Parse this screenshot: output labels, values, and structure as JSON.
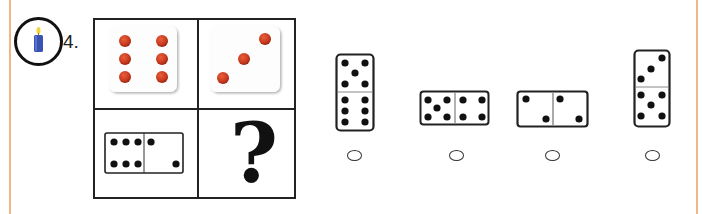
{
  "question": {
    "number_label": "4.",
    "badge_icon": "candle-icon",
    "colors": {
      "page_edge": "#f2b58a",
      "candle_body": "#3a52b0",
      "candle_flame": "#f6d23a",
      "die_pip": "#c8391e",
      "ink": "#111111"
    },
    "grid": {
      "cells": [
        {
          "position": "top-left",
          "type": "die",
          "pips": 6
        },
        {
          "position": "top-right",
          "type": "die",
          "pips": 3
        },
        {
          "position": "bottom-left",
          "type": "domino",
          "orientation": "horizontal",
          "halves": [
            6,
            2
          ]
        },
        {
          "position": "bottom-right",
          "type": "unknown",
          "symbol": "?"
        }
      ],
      "unknown_symbol": "?"
    },
    "options": [
      {
        "id": "A",
        "type": "domino",
        "orientation": "vertical",
        "halves": [
          5,
          6
        ],
        "selected": false
      },
      {
        "id": "B",
        "type": "domino",
        "orientation": "horizontal",
        "halves": [
          5,
          4
        ],
        "selected": false
      },
      {
        "id": "C",
        "type": "domino",
        "orientation": "horizontal",
        "halves": [
          2,
          2
        ],
        "selected": false
      },
      {
        "id": "D",
        "type": "domino",
        "orientation": "vertical",
        "halves": [
          3,
          5
        ],
        "selected": false
      }
    ]
  }
}
